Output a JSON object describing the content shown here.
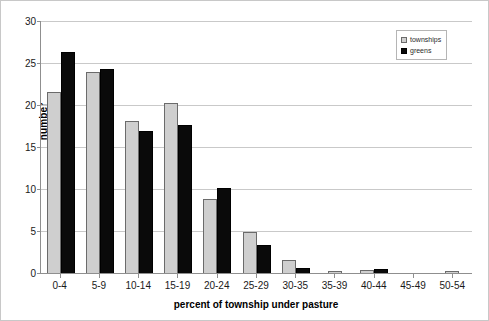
{
  "chart_data": {
    "type": "bar",
    "title": "",
    "xlabel": "percent of township under pasture",
    "ylabel": "number",
    "categories": [
      "0-4",
      "5-9",
      "10-14",
      "15-19",
      "20-24",
      "25-29",
      "30-35",
      "35-39",
      "40-44",
      "45-49",
      "50-54"
    ],
    "series": [
      {
        "name": "townships",
        "color": "#cfcfcf",
        "values": [
          21.5,
          23.9,
          18.1,
          20.2,
          8.8,
          4.9,
          1.5,
          0.2,
          0.4,
          0,
          0.2
        ]
      },
      {
        "name": "greens",
        "color": "#0a0a0a",
        "values": [
          26.3,
          24.3,
          16.9,
          17.6,
          10.1,
          3.3,
          0.6,
          0,
          0.5,
          0,
          0
        ]
      }
    ],
    "ylim": [
      0,
      30
    ],
    "yticks": [
      0,
      5,
      10,
      15,
      20,
      25,
      30
    ],
    "ytick_labels": [
      "0",
      "5",
      "10",
      "15",
      "20",
      "25",
      "30"
    ],
    "grid": true,
    "grid_axis": "y",
    "legend_position": "top-right",
    "legend_entries": [
      "townships",
      "greens"
    ]
  },
  "axes": {
    "y_title": "number",
    "x_title": "percent of township under pasture"
  },
  "legend": {
    "items": [
      {
        "label": "townships",
        "swatch": "legend-swatch-townships"
      },
      {
        "label": "greens",
        "swatch": "legend-swatch-greens"
      }
    ]
  }
}
